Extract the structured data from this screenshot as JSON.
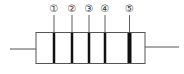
{
  "diagram": {
    "type": "resistor-color-bands",
    "bands": [
      {
        "label": "①",
        "x": 54,
        "width": 2.5
      },
      {
        "label": "②",
        "x": 72,
        "width": 2.5
      },
      {
        "label": "③",
        "x": 89,
        "width": 2.5
      },
      {
        "label": "④",
        "x": 105,
        "width": 2.5
      },
      {
        "label": "⑤",
        "x": 129,
        "width": 4
      }
    ],
    "colors": {
      "outline": "#555555",
      "band": "#111111",
      "lead": "#555555"
    }
  }
}
